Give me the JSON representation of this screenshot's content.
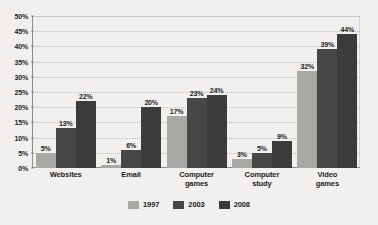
{
  "chart_data": {
    "type": "bar",
    "title": "",
    "subtitle": "",
    "xlabel": "",
    "ylabel": "",
    "ylim": [
      0,
      50
    ],
    "ytick_labels": [
      "0%",
      "5%",
      "10%",
      "15%",
      "20%",
      "25%",
      "30%",
      "35%",
      "40%",
      "45%",
      "50%"
    ],
    "ytick_values": [
      0,
      5,
      10,
      15,
      20,
      25,
      30,
      35,
      40,
      45,
      50
    ],
    "grid": true,
    "grid_style": "dotted-horizontal",
    "legend_position": "bottom-center",
    "value_label_suffix": "%",
    "categories": [
      "Websites",
      "Email",
      "Computer games",
      "Computer study",
      "Video games"
    ],
    "category_lines": [
      [
        "Websites"
      ],
      [
        "Email"
      ],
      [
        "Computer",
        "games"
      ],
      [
        "Computer",
        "study"
      ],
      [
        "Video",
        "games"
      ]
    ],
    "series": [
      {
        "name": "1997",
        "color": "#a9a8a5",
        "values": [
          5,
          1,
          17,
          3,
          32
        ],
        "labels": [
          "5%",
          "1%",
          "17%",
          "3%",
          "32%"
        ]
      },
      {
        "name": "2003",
        "color": "#474747",
        "values": [
          13,
          6,
          23,
          5,
          39
        ],
        "labels": [
          "13%",
          "6%",
          "23%",
          "5%",
          "39%"
        ]
      },
      {
        "name": "2008",
        "color": "#3b3b3b",
        "values": [
          22,
          20,
          24,
          9,
          44
        ],
        "labels": [
          "22%",
          "20%",
          "24%",
          "9%",
          "44%"
        ]
      }
    ]
  },
  "colors": {
    "background": "#f1f0ee",
    "axis": "#8d8d8d",
    "gridline": "#bdbcb8",
    "text": "#1c1c1c",
    "series_1997": "#a9a8a5",
    "series_2003": "#474747",
    "series_2008": "#3b3b3b"
  }
}
